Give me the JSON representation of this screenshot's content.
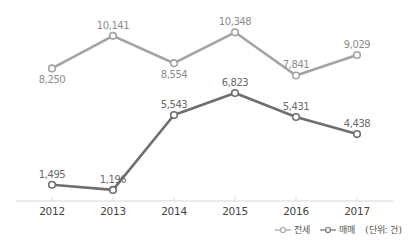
{
  "chart_data": {
    "type": "line",
    "title": "",
    "xlabel": "",
    "ylabel": "",
    "categories": [
      "2012",
      "2013",
      "2014",
      "2015",
      "2016",
      "2017"
    ],
    "series": [
      {
        "name": "전세",
        "color": "#a3a3a3",
        "values": [
          8250,
          10141,
          8554,
          10348,
          7841,
          9029
        ],
        "labels": [
          "8,250",
          "10,141",
          "8,554",
          "10,348",
          "7,841",
          "9,029"
        ]
      },
      {
        "name": "매매",
        "color": "#6e6e6e",
        "values": [
          1495,
          1196,
          5543,
          6823,
          5431,
          4438
        ],
        "labels": [
          "1,495",
          "1,196",
          "5,543",
          "6,823",
          "5,431",
          "4,438"
        ]
      }
    ],
    "grid": false,
    "legend_position": "bottom-right",
    "unit": "(단위: 건)"
  },
  "legend": {
    "items": [
      {
        "label": "전세",
        "color": "#a3a3a3"
      },
      {
        "label": "매매",
        "color": "#6e6e6e"
      }
    ],
    "unit": "(단위: 건)"
  }
}
